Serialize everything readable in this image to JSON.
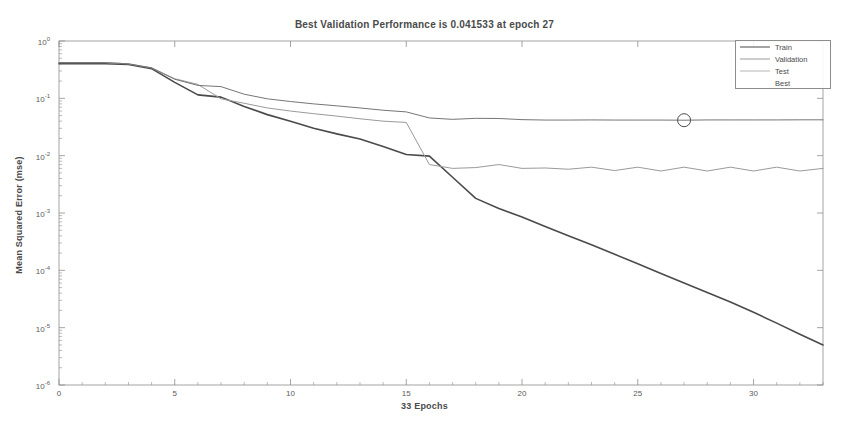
{
  "chart_data": {
    "type": "line",
    "title": "Best Validation Performance is 0.041533 at epoch 27",
    "xlabel": "33 Epochs",
    "ylabel": "Mean Squared Error (mse)",
    "scale": "semilogy",
    "grid": false,
    "legend_position": "top-right",
    "xlim": [
      0,
      33
    ],
    "ylim": [
      1e-06,
      1
    ],
    "xticks": [
      0,
      5,
      10,
      15,
      20,
      25,
      30
    ],
    "xtick_labels": [
      "0",
      "5",
      "10",
      "15",
      "20",
      "25",
      "30"
    ],
    "yticks": [
      1,
      0.1,
      0.01,
      0.001,
      0.0001,
      1e-05,
      1e-06
    ],
    "ytick_labels": [
      "10^0",
      "10^-1",
      "10^-2",
      "10^-3",
      "10^-4",
      "10^-5",
      "10^-6"
    ],
    "ytick_mantissa": [
      "10",
      "10",
      "10",
      "10",
      "10",
      "10",
      "10"
    ],
    "ytick_exponent": [
      "0",
      "-1",
      "-2",
      "-3",
      "-4",
      "-5",
      "-6"
    ],
    "x": [
      0,
      1,
      2,
      3,
      4,
      5,
      6,
      7,
      8,
      9,
      10,
      11,
      12,
      13,
      14,
      15,
      16,
      17,
      18,
      19,
      20,
      21,
      22,
      23,
      24,
      25,
      26,
      27,
      28,
      29,
      30,
      31,
      32,
      33
    ],
    "series": [
      {
        "name": "Train",
        "color": "#4a4a4a",
        "width": 1.6,
        "values": [
          0.4,
          0.4,
          0.4,
          0.39,
          0.33,
          0.19,
          0.115,
          0.105,
          0.072,
          0.052,
          0.04,
          0.03,
          0.024,
          0.0195,
          0.0145,
          0.0105,
          0.0098,
          0.0042,
          0.0018,
          0.0012,
          0.00085,
          0.00058,
          0.0004,
          0.00028,
          0.00019,
          0.00013,
          8.8e-05,
          6e-05,
          4.1e-05,
          2.8e-05,
          1.85e-05,
          1.2e-05,
          7.7e-06,
          5e-06
        ]
      },
      {
        "name": "Validation",
        "color": "#9a9a9a",
        "width": 1.0,
        "values": [
          0.42,
          0.42,
          0.42,
          0.4,
          0.34,
          0.22,
          0.175,
          0.098,
          0.082,
          0.068,
          0.06,
          0.054,
          0.049,
          0.044,
          0.04,
          0.038,
          0.007,
          0.006,
          0.0062,
          0.007,
          0.006,
          0.0061,
          0.0058,
          0.0063,
          0.0055,
          0.0063,
          0.0054,
          0.0063,
          0.0054,
          0.0063,
          0.0054,
          0.0063,
          0.0054,
          0.006
        ]
      },
      {
        "name": "Test",
        "color": "#757575",
        "width": 1.0,
        "values": [
          0.42,
          0.42,
          0.42,
          0.4,
          0.34,
          0.215,
          0.168,
          0.16,
          0.118,
          0.098,
          0.088,
          0.08,
          0.074,
          0.068,
          0.062,
          0.058,
          0.0455,
          0.043,
          0.0448,
          0.0445,
          0.0425,
          0.0418,
          0.0418,
          0.042,
          0.0418,
          0.0418,
          0.0418,
          0.041533,
          0.042,
          0.042,
          0.042,
          0.042,
          0.0422,
          0.0422
        ]
      }
    ],
    "best_marker": {
      "name": "Best",
      "epoch": 27,
      "value": 0.041533,
      "color": "#4a4a4a"
    },
    "legend": [
      {
        "label": "Train",
        "color": "#4a4a4a",
        "width": 1.8,
        "has_line": true
      },
      {
        "label": "Validation",
        "color": "#9a9a9a",
        "width": 1.1,
        "has_line": true
      },
      {
        "label": "Test",
        "color": "#b5b5b5",
        "width": 1.0,
        "has_line": true
      },
      {
        "label": "Best",
        "color": "#4a4a4a",
        "width": 0,
        "has_line": false
      }
    ]
  },
  "axes": {
    "frame_color": "#8d8d8d"
  }
}
